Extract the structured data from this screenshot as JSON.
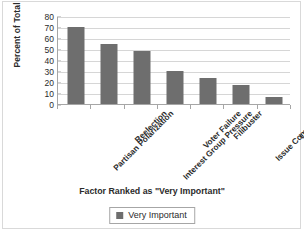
{
  "chart_data": {
    "type": "bar",
    "title": "",
    "categories": [
      "Partisan Polarization",
      "Reelection",
      "Interest Group Pressure",
      "Voter Failure",
      "Filibuster",
      "Issue Complexity",
      "Lack Info"
    ],
    "values": [
      70,
      55,
      48,
      30,
      24,
      17,
      6
    ],
    "series": [
      {
        "name": "Very Important",
        "values": [
          70,
          55,
          48,
          30,
          24,
          17,
          6
        ],
        "color": "#6e6e6e"
      }
    ],
    "xlabel": "Factor Ranked as \"Very Important\"",
    "ylabel": "Percent of Total",
    "ylim": [
      0,
      80
    ],
    "ytick_step": 10,
    "yticks": [
      80,
      70,
      60,
      50,
      40,
      30,
      20,
      10,
      0
    ],
    "grid": true,
    "grid_axis": "y",
    "legend": {
      "position": "bottom",
      "entries": [
        "Very Important"
      ]
    }
  },
  "colors": {
    "bar": "#6e6e6e",
    "gridline": "#d6d6d6",
    "axis": "#a6a6a6",
    "text": "#2b2b2b",
    "frame": "#d9d9d9",
    "background": "#ffffff"
  }
}
